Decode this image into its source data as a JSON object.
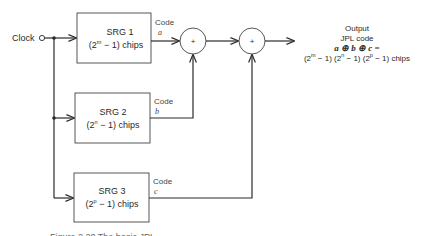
{
  "clock": {
    "label": "Clock"
  },
  "srg": [
    {
      "title": "SRG 1",
      "chips_prefix": "(2",
      "exponent": "m",
      "chips_suffix": " − 1) chips",
      "code_label": "Code",
      "code_var": "a"
    },
    {
      "title": "SRG 2",
      "chips_prefix": "(2",
      "exponent": "n",
      "chips_suffix": " − 1) chips",
      "code_label": "Code",
      "code_var": "b"
    },
    {
      "title": "SRG 3",
      "chips_prefix": "(2",
      "exponent": "p",
      "chips_suffix": " − 1) chips",
      "code_label": "Code",
      "code_var": "c"
    }
  ],
  "adders": [
    {
      "symbol": "+"
    },
    {
      "symbol": "+"
    }
  ],
  "output": {
    "line1": "Output",
    "line2": "JPL code",
    "line3": "a ⊕ b ⊕ c =",
    "line4": {
      "p1": "(2",
      "e1": "m",
      "p2": " − 1) (2",
      "e2": "n",
      "p3": " − 1) (2",
      "e3": "p",
      "p4": " − 1) chips"
    }
  },
  "caption": {
    "partial": "Figure 2.20  The basic JPL ..."
  }
}
